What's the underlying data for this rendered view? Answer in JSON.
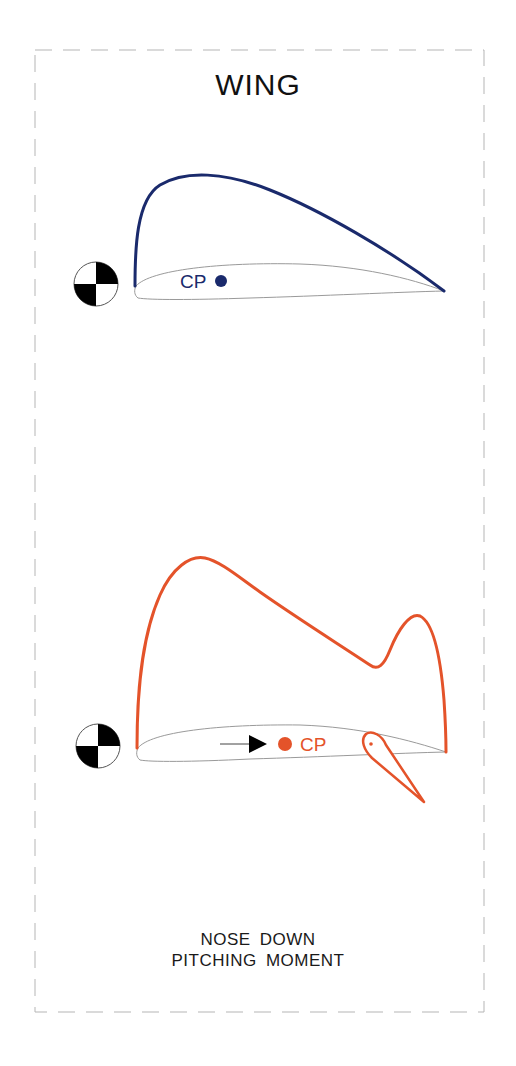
{
  "title": "WING",
  "diagrams": [
    {
      "id": "upper",
      "label": "CP",
      "color": "#1a2a6c",
      "description": "Lift distribution over airfoil, CP forward"
    },
    {
      "id": "lower",
      "label": "CP",
      "color": "#e4532a",
      "description": "Lift distribution with deflected flap, CP moved aft",
      "arrow": "aft"
    }
  ],
  "caption": {
    "line1": "NOSE  DOWN",
    "line2": "PITCHING  MOMENT"
  },
  "colors": {
    "border": "#b0b0b0",
    "airfoil": "#9a9a9a",
    "cg": "#000000"
  }
}
